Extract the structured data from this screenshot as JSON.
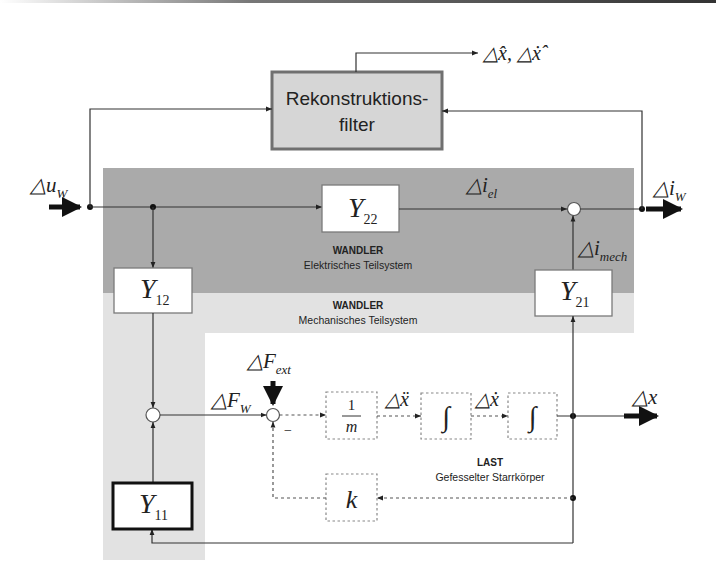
{
  "diagram": {
    "colors": {
      "electrical_band": "#aaaaaa",
      "mechanical_band": "#e2e2e2",
      "filter_fill": "#d6d6d6",
      "filter_border": "#707070",
      "line": "#333333"
    },
    "filter": {
      "label_line1": "Rekonstruktions-",
      "label_line2": "filter"
    },
    "filter_output": {
      "label": "△x̂, △ẋ̂"
    },
    "input": {
      "symbol": "△u",
      "subscript": "W"
    },
    "output_current": {
      "symbol": "△i",
      "subscript": "W"
    },
    "signals": {
      "i_el": {
        "symbol": "△i",
        "subscript": "el"
      },
      "i_mech": {
        "symbol": "△i",
        "subscript": "mech"
      },
      "F_W": {
        "symbol": "△F",
        "subscript": "W"
      },
      "F_ext": {
        "symbol": "△F",
        "subscript": "ext"
      },
      "x_ddot": "△ẍ",
      "x_dot": "△ẋ",
      "x": "△x"
    },
    "blocks": {
      "Y22": {
        "symbol": "Y",
        "subscript": "22"
      },
      "Y12": {
        "symbol": "Y",
        "subscript": "12"
      },
      "Y21": {
        "symbol": "Y",
        "subscript": "21"
      },
      "Y11": {
        "symbol": "Y",
        "subscript": "11"
      },
      "inv_mass": {
        "numerator": "1",
        "denominator": "m"
      },
      "integrator1": "∫",
      "integrator2": "∫",
      "stiffness": "k"
    },
    "regions": {
      "electrical": {
        "title": "WANDLER",
        "subtitle": "Elektrisches Teilsystem"
      },
      "mechanical": {
        "title": "WANDLER",
        "subtitle": "Mechanisches Teilsystem"
      },
      "load": {
        "title": "LAST",
        "subtitle": "Gefesselter Starrkörper"
      }
    },
    "sign": {
      "minus": "−"
    }
  }
}
